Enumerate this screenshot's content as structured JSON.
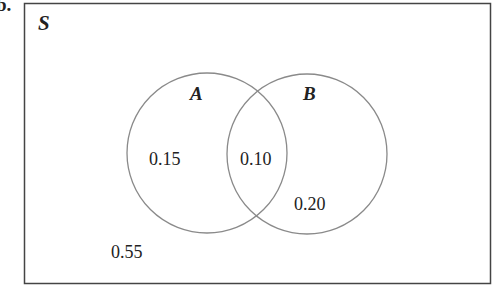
{
  "part_label": "b.",
  "diagram": {
    "type": "venn",
    "universe_label": "S",
    "sets": [
      {
        "name": "A",
        "only_value": "0.15"
      },
      {
        "name": "B",
        "only_value": "0.20"
      }
    ],
    "intersection_value": "0.10",
    "outside_value": "0.55",
    "colors": {
      "frame": "#444444",
      "circles": "#8a8a8a",
      "text": "#222222"
    }
  }
}
